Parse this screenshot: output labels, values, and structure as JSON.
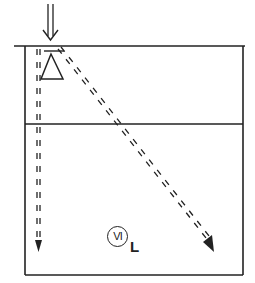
{
  "diagram": {
    "colors": {
      "stroke": "#222222",
      "background": "#ffffff"
    },
    "label": {
      "symbol": "VI",
      "subscript": "L"
    },
    "elements": {
      "incident_arrow": "double-down-arrow",
      "prism": "triangle",
      "rays": [
        "vertical-dashed-arrow",
        "oblique-dashed-arrow"
      ],
      "layers": 2
    }
  }
}
